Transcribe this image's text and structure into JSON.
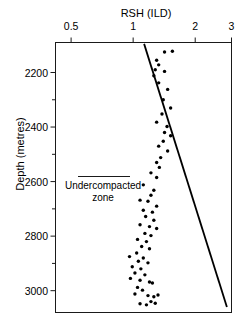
{
  "chart": {
    "title": "RSH (ILD)",
    "ylabel": "Depth (metres)"
  },
  "annotations": {
    "undercompacted_line1": "Undercompacted",
    "undercompacted_line2": "zone"
  },
  "chart_data": {
    "type": "scatter",
    "title": "RSH (ILD)",
    "subtitle": "",
    "xlabel": "RSH (ILD)",
    "ylabel": "Depth (metres)",
    "x_scale": "log",
    "xlim": [
      0.42,
      3.0
    ],
    "ylim": [
      3080,
      2090
    ],
    "y_inverted": true,
    "grid": false,
    "legend": null,
    "x_axis_position": "top",
    "xticks": [
      0.5,
      1,
      2,
      3
    ],
    "xtick_labels": [
      "0.5",
      "1",
      "2",
      "3"
    ],
    "yticks": [
      2200,
      2400,
      2600,
      2800,
      3000
    ],
    "ytick_labels": [
      "2200",
      "2400",
      "2600",
      "2800",
      "3000"
    ],
    "y_minor_ticks": [
      2300,
      2500,
      2700,
      2900
    ],
    "series": [
      {
        "name": "RSH (ILD) log data",
        "type": "scatter",
        "marker": "filled-circle",
        "color": "#000000",
        "points": [
          [
            1.42,
            2125
          ],
          [
            1.55,
            2122
          ],
          [
            1.3,
            2155
          ],
          [
            1.33,
            2172
          ],
          [
            1.28,
            2190
          ],
          [
            1.42,
            2196
          ],
          [
            1.26,
            2212
          ],
          [
            1.33,
            2238
          ],
          [
            1.47,
            2262
          ],
          [
            1.4,
            2300
          ],
          [
            1.52,
            2330
          ],
          [
            1.38,
            2352
          ],
          [
            1.3,
            2382
          ],
          [
            1.46,
            2398
          ],
          [
            1.42,
            2420
          ],
          [
            1.52,
            2432
          ],
          [
            1.4,
            2452
          ],
          [
            1.33,
            2470
          ],
          [
            1.47,
            2488
          ],
          [
            1.36,
            2512
          ],
          [
            1.3,
            2530
          ],
          [
            1.34,
            2548
          ],
          [
            1.22,
            2568
          ],
          [
            1.3,
            2585
          ],
          [
            1.12,
            2612
          ],
          [
            1.26,
            2632
          ],
          [
            1.22,
            2650
          ],
          [
            1.08,
            2668
          ],
          [
            1.18,
            2672
          ],
          [
            1.3,
            2690
          ],
          [
            1.12,
            2705
          ],
          [
            1.24,
            2712
          ],
          [
            1.15,
            2728
          ],
          [
            1.26,
            2742
          ],
          [
            1.08,
            2758
          ],
          [
            1.2,
            2765
          ],
          [
            1.3,
            2772
          ],
          [
            1.14,
            2790
          ],
          [
            1.22,
            2798
          ],
          [
            1.05,
            2812
          ],
          [
            1.16,
            2820
          ],
          [
            1.1,
            2838
          ],
          [
            1.2,
            2846
          ],
          [
            1.04,
            2862
          ],
          [
            0.96,
            2875
          ],
          [
            1.12,
            2880
          ],
          [
            1.06,
            2892
          ],
          [
            1.18,
            2898
          ],
          [
            0.99,
            2912
          ],
          [
            1.09,
            2920
          ],
          [
            1.02,
            2935
          ],
          [
            1.14,
            2942
          ],
          [
            0.97,
            2955
          ],
          [
            1.08,
            2962
          ],
          [
            1.2,
            2968
          ],
          [
            1.24,
            2972
          ],
          [
            1.05,
            2988
          ],
          [
            1.11,
            2998
          ],
          [
            1.02,
            3012
          ],
          [
            1.18,
            3018
          ],
          [
            1.26,
            3022
          ],
          [
            1.32,
            3016
          ],
          [
            1.22,
            3040
          ],
          [
            1.08,
            3048
          ],
          [
            1.16,
            3052
          ],
          [
            1.28,
            3046
          ]
        ]
      }
    ],
    "trend_line": {
      "name": "Normal compaction trend",
      "type": "line",
      "color": "#000000",
      "points": [
        [
          1.13,
          2095
        ],
        [
          2.85,
          3060
        ]
      ]
    },
    "annotations": [
      {
        "text": "Undercompacted zone",
        "x": 0.78,
        "y": 2660,
        "leader_line": true
      }
    ]
  }
}
